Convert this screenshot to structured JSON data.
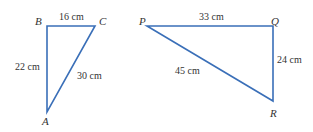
{
  "diagram": {
    "line_color": "#3a6fb8",
    "triangles": [
      {
        "name": "ABC",
        "vertices": {
          "A": "A",
          "B": "B",
          "C": "C"
        },
        "sides": {
          "BC": "16 cm",
          "AB": "22 cm",
          "AC": "30 cm"
        }
      },
      {
        "name": "PQR",
        "vertices": {
          "P": "P",
          "Q": "Q",
          "R": "R"
        },
        "sides": {
          "PQ": "33 cm",
          "QR": "24 cm",
          "PR": "45 cm"
        }
      }
    ]
  }
}
